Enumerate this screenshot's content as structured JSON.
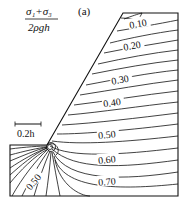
{
  "figure": {
    "panel_label": "(a)",
    "quantity_numerator": "σ₁+σ₃",
    "quantity_denominator": "2ρgh",
    "scale_bar_label": "0.2h",
    "contour_labels": [
      "0.10",
      "0.20",
      "0.30",
      "0.40",
      "0.50",
      "0.60",
      "0.70"
    ],
    "lower_left_label": "0.50",
    "line_color": "#111111"
  }
}
